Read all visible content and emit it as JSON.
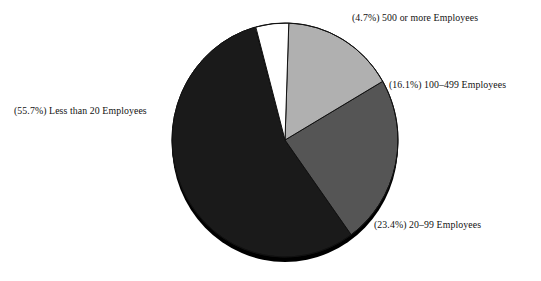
{
  "chart_data": {
    "type": "pie",
    "title": "",
    "subtitle": "",
    "xlabel": "",
    "ylabel": "",
    "legend_position": "outside-labels",
    "grid": false,
    "categories": [
      "Less than 20 Employees",
      "20–99 Employees",
      "100–499 Employees",
      "500 or more Employees"
    ],
    "values": [
      55.7,
      23.4,
      16.1,
      4.7
    ],
    "value_unit": "percent",
    "slices": [
      {
        "id": "less-than-20",
        "label": "Less than 20 Employees",
        "percent": 55.7,
        "percent_text": "55.7%",
        "display_text": "(55.7%) Less than 20 Employees",
        "color": "#1a1a1a",
        "start_angle_deg": 84.6,
        "sweep_deg": 200.5
      },
      {
        "id": "20-to-99",
        "label": "20–99 Employees",
        "percent": 23.4,
        "percent_text": "23.4%",
        "display_text": "(23.4%) 20–99 Employees",
        "color": "#555555",
        "start_angle_deg": 0.0,
        "sweep_deg": 84.2
      },
      {
        "id": "100-to-499",
        "label": "100–499 Employees",
        "percent": 16.1,
        "percent_text": "16.1%",
        "display_text": "(16.1%) 100–499 Employees",
        "color": "#b0b0b0",
        "start_angle_deg": 302.0,
        "sweep_deg": 58.0
      },
      {
        "id": "500-or-more",
        "label": "500 or more Employees",
        "percent": 4.7,
        "percent_text": "4.7%",
        "display_text": "(4.7%) 500 or more Employees",
        "color": "#ffffff",
        "start_angle_deg": 285.1,
        "sweep_deg": 16.9
      }
    ]
  },
  "labels": {
    "less_than_20": "(55.7%) Less than 20 Employees",
    "twenty_to_99": "(23.4%) 20–99 Employees",
    "hundred_to_499": "(16.1%) 100–499 Employees",
    "five_hundred_plus": "(4.7%) 500 or more Employees"
  },
  "colors": {
    "slice_less_than_20": "#1a1a1a",
    "slice_20_to_99": "#555555",
    "slice_100_to_499": "#b0b0b0",
    "slice_500_or_more": "#ffffff",
    "outline": "#111111",
    "background": "#ffffff",
    "depth_shadow": "#000000",
    "label_text": "#111111"
  },
  "geometry": {
    "center_x": 285,
    "center_y": 140,
    "radius_x": 113,
    "radius_y": 117,
    "depth_offset_y": 5
  }
}
